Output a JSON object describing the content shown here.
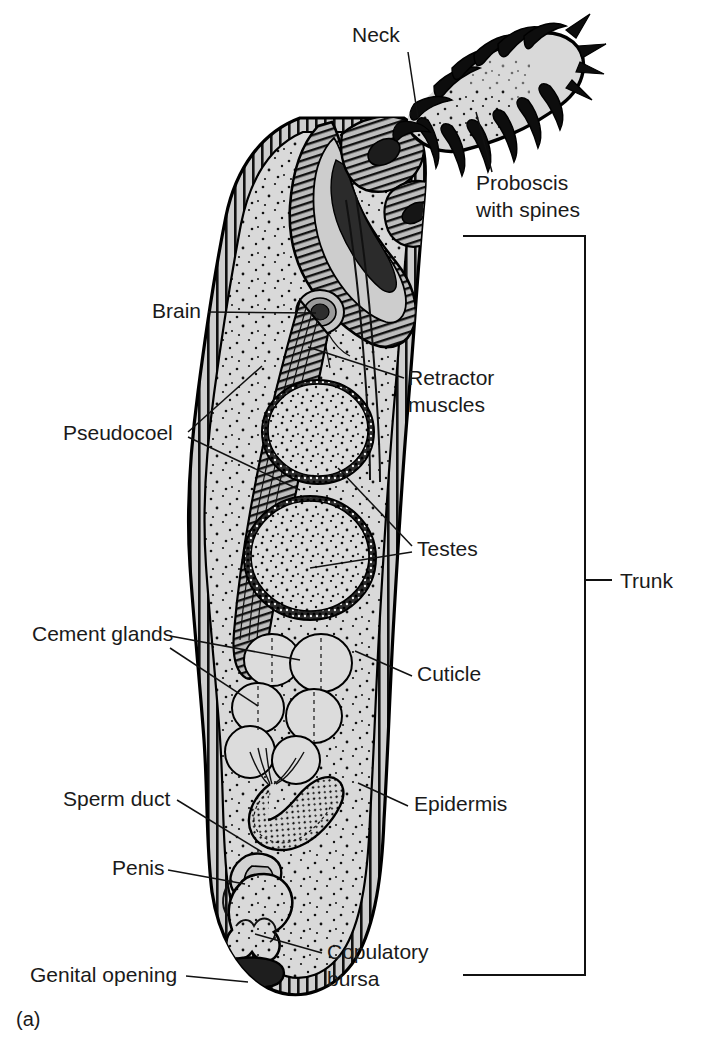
{
  "figure": {
    "caption": "(a)",
    "background_color": "#ffffff",
    "ink_color": "#111111",
    "body_fill_color": "#d8d8d8",
    "stipple_color": "#111111"
  },
  "labels": [
    {
      "id": "neck",
      "text": "Neck",
      "x": 352,
      "y": 42,
      "anchor": "start"
    },
    {
      "id": "proboscis",
      "text": "Proboscis",
      "x": 476,
      "y": 190,
      "anchor": "start"
    },
    {
      "id": "proboscis_line2",
      "text": "with spines",
      "x": 476,
      "y": 217,
      "anchor": "start"
    },
    {
      "id": "brain",
      "text": "Brain",
      "x": 152,
      "y": 318,
      "anchor": "start"
    },
    {
      "id": "retractor",
      "text": "Retractor",
      "x": 408,
      "y": 385,
      "anchor": "start"
    },
    {
      "id": "retractor_line2",
      "text": "muscles",
      "x": 408,
      "y": 412,
      "anchor": "start"
    },
    {
      "id": "pseudocoel",
      "text": "Pseudocoel",
      "x": 63,
      "y": 440,
      "anchor": "start"
    },
    {
      "id": "testes",
      "text": "Testes",
      "x": 417,
      "y": 556,
      "anchor": "start"
    },
    {
      "id": "trunk",
      "text": "Trunk",
      "x": 620,
      "y": 588,
      "anchor": "start"
    },
    {
      "id": "cement_glands",
      "text": "Cement glands",
      "x": 32,
      "y": 641,
      "anchor": "start"
    },
    {
      "id": "cuticle",
      "text": "Cuticle",
      "x": 417,
      "y": 681,
      "anchor": "start"
    },
    {
      "id": "epidermis",
      "text": "Epidermis",
      "x": 414,
      "y": 811,
      "anchor": "start"
    },
    {
      "id": "sperm_duct",
      "text": "Sperm duct",
      "x": 63,
      "y": 806,
      "anchor": "start"
    },
    {
      "id": "penis",
      "text": "Penis",
      "x": 112,
      "y": 875,
      "anchor": "start"
    },
    {
      "id": "copulatory",
      "text": "Copulatory",
      "x": 327,
      "y": 959,
      "anchor": "start"
    },
    {
      "id": "copulatory_l2",
      "text": "bursa",
      "x": 327,
      "y": 986,
      "anchor": "start"
    },
    {
      "id": "genital_opening",
      "text": "Genital opening",
      "x": 30,
      "y": 982,
      "anchor": "start"
    }
  ],
  "leader_lines": [
    {
      "id": "neck-leader",
      "points": "408,52 418,118"
    },
    {
      "id": "proboscis-leader",
      "points": "492,172 476,112"
    },
    {
      "id": "brain-leader",
      "points": "208,312 316,313"
    },
    {
      "id": "retractor-leader",
      "points": "404,378 308,347"
    },
    {
      "id": "pseudocoel-leader-a",
      "points": "188,432 262,366"
    },
    {
      "id": "pseudocoel-leader-b",
      "points": "188,437 300,490"
    },
    {
      "id": "testes-leader",
      "points": "412,552 310,568"
    },
    {
      "id": "testes-leader-b",
      "points": "412,546 338,468"
    },
    {
      "id": "cement-leader-a",
      "points": "170,636 300,660"
    },
    {
      "id": "cement-leader-b",
      "points": "170,648 258,706"
    },
    {
      "id": "cuticle-leader",
      "points": "412,676 355,651"
    },
    {
      "id": "epidermis-leader",
      "points": "408,806 358,783"
    },
    {
      "id": "spermduct-leader",
      "points": "177,800 262,852"
    },
    {
      "id": "penis-leader",
      "points": "168,870 245,884"
    },
    {
      "id": "copulatory-leader",
      "points": "322,953 255,934"
    },
    {
      "id": "genital-leader",
      "points": "186,976 248,982"
    }
  ],
  "trunk_bracket": {
    "id": "trunk-bracket",
    "top_y": 236,
    "bottom_y": 975,
    "left_x": 463,
    "spine_x": 585,
    "tick_y": 580,
    "tick_end_x": 612
  },
  "anatomy_parts": [
    {
      "id": "proboscis",
      "name": "Proboscis with spines",
      "description": "club-shaped eversible organ angled upper-right bearing recurved hooks"
    },
    {
      "id": "neck",
      "name": "Neck",
      "description": "short unarmed zone between proboscis and trunk"
    },
    {
      "id": "trunk",
      "name": "Trunk",
      "description": "elongated sac-like body making up most of the worm"
    },
    {
      "id": "proboscis-receptacle",
      "name": "Proboscis receptacle",
      "description": "double-walled muscular sac enclosing inverted proboscis"
    },
    {
      "id": "brain",
      "name": "Brain",
      "description": "small dark ganglion within proboscis receptacle"
    },
    {
      "id": "retractor-muscles",
      "name": "Retractor muscles",
      "description": "long striated bands running from receptacle into trunk"
    },
    {
      "id": "pseudocoel",
      "name": "Pseudocoel",
      "description": "fluid-filled body cavity with stippled fill"
    },
    {
      "id": "testes-anterior",
      "name": "Anterior testis",
      "description": "upper oval gonad with granular capsule"
    },
    {
      "id": "testes-posterior",
      "name": "Posterior testis",
      "description": "lower larger oval gonad with granular capsule"
    },
    {
      "id": "cement-glands",
      "name": "Cement glands",
      "description": "cluster of six rounded glands posterior to testes"
    },
    {
      "id": "sperm-duct",
      "name": "Sperm duct",
      "description": "coiled tube leading from cement glands to penis"
    },
    {
      "id": "penis",
      "name": "Penis",
      "description": "convoluted copulatory structure near posterior end"
    },
    {
      "id": "copulatory-bursa",
      "name": "Copulatory bursa",
      "description": "bell-shaped terminal expansion"
    },
    {
      "id": "genital-opening",
      "name": "Genital opening",
      "description": "terminal pore at posterior tip"
    },
    {
      "id": "cuticle",
      "name": "Cuticle",
      "description": "outer striated layer of body wall"
    },
    {
      "id": "epidermis",
      "name": "Epidermis",
      "description": "inner layer of body wall beneath cuticle"
    }
  ]
}
